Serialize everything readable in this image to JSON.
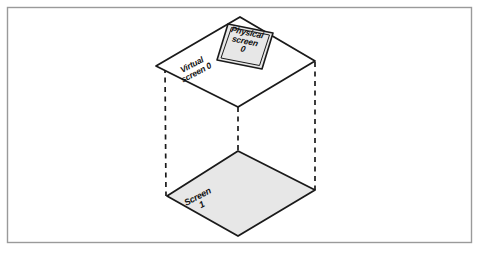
{
  "figure": {
    "frame": {
      "border_color": "#9a9a9a",
      "background": "#ffffff"
    },
    "palette": {
      "outline": "#1a1a1a",
      "fill_gray": "#e7e7e7",
      "fill_white": "#ffffff",
      "dashed_line": "#1a1a1a",
      "text": "#111111"
    },
    "shapes": {
      "virtual_screen_plane": {
        "name": "virtual-screen-plane",
        "fill": "#ffffff",
        "points": "240,17 315,61 238,107 156,66"
      },
      "physical_screen_box": {
        "name": "physical-screen-box",
        "fill": "#e7e7e7",
        "points": "228,24 273,33 262,69 217,60"
      },
      "physical_screen_box_inner": {
        "name": "physical-screen-box-inner",
        "points": "231,27 270,35 260,66 220,58"
      },
      "screen_1_plane": {
        "name": "screen-1-plane",
        "fill": "#e7e7e7",
        "points": "238,151 315,190 238,236 167,196"
      }
    },
    "dashed_edges": [
      {
        "name": "dashed-edge-left",
        "x1": 165,
        "y1": 68,
        "x2": 166,
        "y2": 196
      },
      {
        "name": "dashed-edge-center",
        "x1": 238,
        "y1": 107,
        "x2": 238,
        "y2": 236
      },
      {
        "name": "dashed-edge-right",
        "x1": 315,
        "y1": 62,
        "x2": 315,
        "y2": 190
      }
    ],
    "labels": {
      "physical_screen": {
        "name": "physical-screen-label",
        "line1": "Physical",
        "line2": "screen",
        "line3": "0"
      },
      "virtual_screen": {
        "name": "virtual-screen-label",
        "line1": "Virtual",
        "line2": "screen 0"
      },
      "screen_1": {
        "name": "screen-1-label",
        "line1": "Screen",
        "line2": "1"
      }
    }
  }
}
